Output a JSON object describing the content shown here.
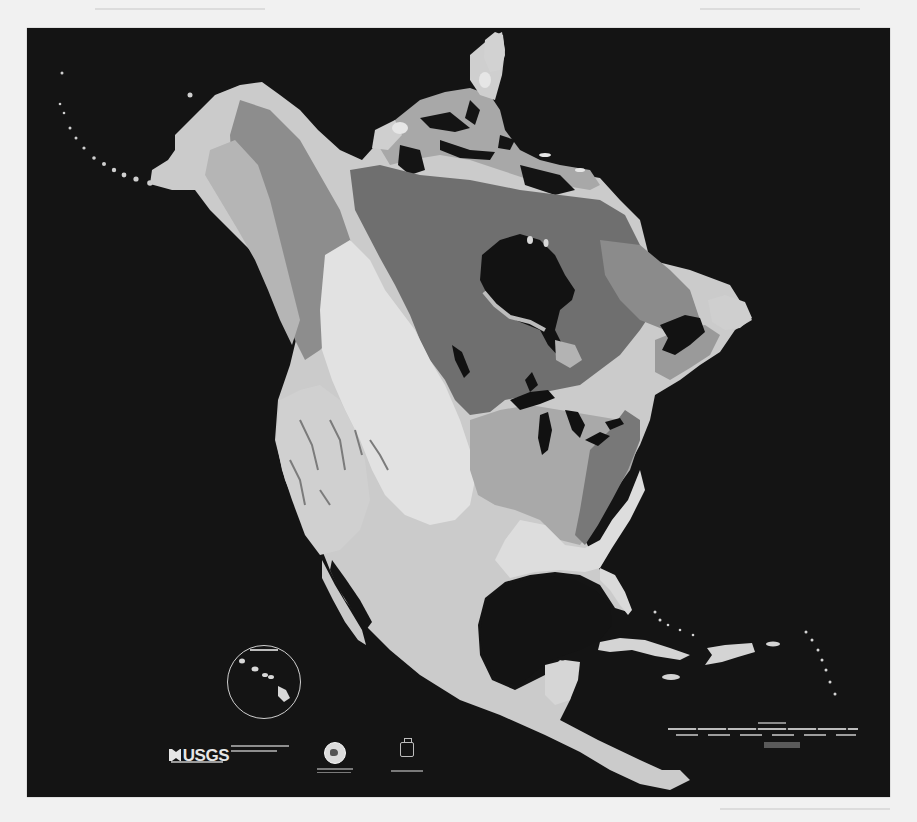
{
  "document": {
    "type": "scanned-map-poster",
    "color_mode": "grayscale"
  },
  "map": {
    "subject": "Geologic map of North America",
    "background_color": "#141414",
    "page_color": "#f1f1f1",
    "land_tones": {
      "lightest": "#e2e2e2",
      "light": "#c9c9c9",
      "mid": "#9a9a9a",
      "dark": "#6e6e6e",
      "darkest": "#575757",
      "water": "#111111"
    },
    "regions": [
      {
        "name": "Alaska"
      },
      {
        "name": "Canadian Arctic Archipelago"
      },
      {
        "name": "Greenland (partial)"
      },
      {
        "name": "Canadian Shield"
      },
      {
        "name": "Hudson Bay"
      },
      {
        "name": "Great Lakes"
      },
      {
        "name": "Cordillera / Rocky Mountains"
      },
      {
        "name": "Great Plains"
      },
      {
        "name": "Appalachians"
      },
      {
        "name": "Atlantic Coastal Plain"
      },
      {
        "name": "Gulf of Mexico"
      },
      {
        "name": "Florida"
      },
      {
        "name": "Mexico"
      },
      {
        "name": "Baja California"
      },
      {
        "name": "Yucatan Peninsula"
      },
      {
        "name": "Central America"
      },
      {
        "name": "Cuba"
      },
      {
        "name": "Hispaniola"
      },
      {
        "name": "Jamaica"
      },
      {
        "name": "Lesser Antilles"
      },
      {
        "name": "Newfoundland / Labrador"
      }
    ],
    "inset": {
      "name": "Hawaii inset"
    }
  },
  "footer": {
    "logo_text": "USGS",
    "has_department_text": true,
    "has_partner_seal": true,
    "has_institution_logo": true,
    "has_scale_bar": true
  }
}
